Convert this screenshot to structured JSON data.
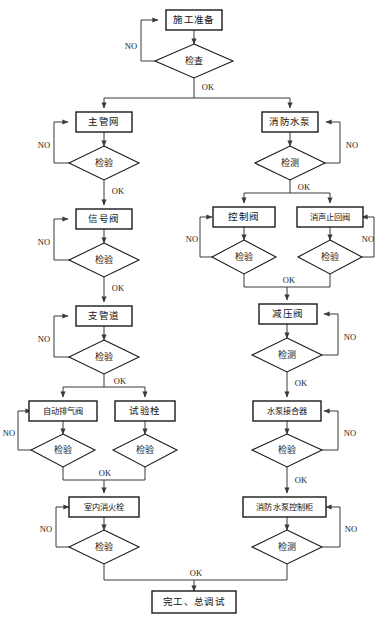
{
  "diagram": {
    "type": "flowchart",
    "labels": {
      "yes": "OK",
      "no": "NO"
    },
    "nodes": {
      "prep": "施工准备",
      "prep_check": "检查",
      "main_pipe": "主管网",
      "main_pipe_check": "检验",
      "signal_valve": "信号阀",
      "signal_valve_check": "检验",
      "branch_pipe": "支管道",
      "branch_pipe_check": "检验",
      "auto_exhaust_valve": "自动排气阀",
      "auto_exhaust_valve_check": "检验",
      "test_hydrant": "试验栓",
      "test_hydrant_check": "检验",
      "indoor_hydrant": "室内消火栓",
      "indoor_hydrant_check": "检验",
      "fire_pump": "消防水泵",
      "fire_pump_check": "检测",
      "control_valve": "控制阀",
      "control_valve_check": "检验",
      "silencing_check_valve": "消声止回阀",
      "silencing_check_valve_check": "检验",
      "reducing_valve": "减压阀",
      "reducing_valve_check": "检测",
      "pump_adapter": "水泵接合器",
      "pump_adapter_check": "检验",
      "pump_control_cabinet": "消防水泵控制柜",
      "pump_control_cabinet_check": "检测",
      "completion": "完工、总调试"
    },
    "edge_labels": {
      "prep_no": "NO",
      "prep_ok": "OK",
      "main_pipe_no": "NO",
      "main_pipe_ok": "OK",
      "signal_valve_no": "NO",
      "signal_valve_ok": "OK",
      "branch_pipe_no": "NO",
      "branch_pipe_ok": "OK",
      "auto_exhaust_no": "NO",
      "left_merge_ok": "OK",
      "indoor_hydrant_no": "NO",
      "indoor_hydrant_ok": "OK",
      "fire_pump_no": "NO",
      "fire_pump_ok": "OK",
      "control_valve_no": "NO",
      "silencing_no": "NO",
      "right_merge_ok": "OK",
      "reducing_valve_no": "NO",
      "reducing_valve_ok": "OK",
      "pump_adapter_no": "NO",
      "pump_adapter_ok": "OK",
      "cabinet_no": "NO",
      "cabinet_ok": "OK"
    },
    "colors": {
      "box_stroke": "#1a1a1a",
      "edge_stroke": "#3a3a3a",
      "background": "#ffffff",
      "text": "#111111"
    }
  }
}
